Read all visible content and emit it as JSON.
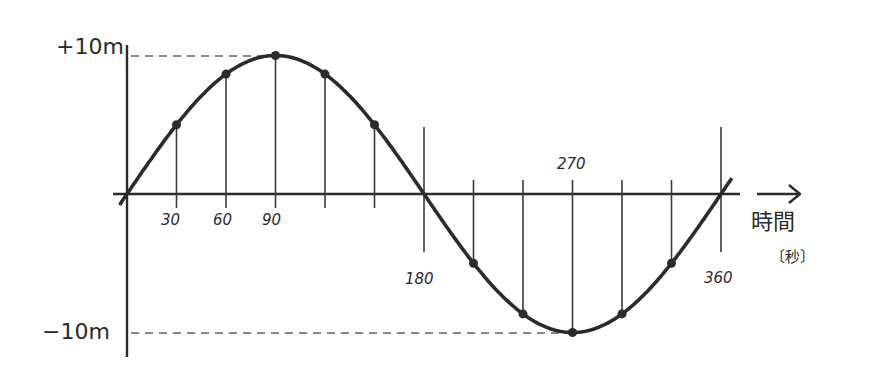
{
  "labels": {
    "y_max": "+10m",
    "y_min": "−10m",
    "x_title": "時間",
    "x_unit": "〔秒〕",
    "ticks": {
      "t30": "30",
      "t60": "60",
      "t90": "90",
      "t180": "180",
      "t270": "270",
      "t360": "360"
    }
  },
  "colors": {
    "curve": "#2b2b2b",
    "axis": "#2b2b2b",
    "guide": "#3a3a3a",
    "dashed": "#888888"
  },
  "chart_data": {
    "type": "line",
    "title": "",
    "xlabel": "時間 〔秒〕",
    "ylabel": "",
    "x": [
      0,
      30,
      60,
      90,
      120,
      150,
      180,
      210,
      240,
      270,
      300,
      330,
      360
    ],
    "series": [
      {
        "name": "displacement (m)",
        "values": [
          0,
          5,
          8.66,
          10,
          8.66,
          5,
          0,
          -5,
          -8.66,
          -10,
          -8.66,
          -5,
          0
        ]
      }
    ],
    "xticks_labeled": [
      30,
      60,
      90,
      180,
      270,
      360
    ],
    "yticks_labeled": [
      "+10m",
      "−10m"
    ],
    "xlim": [
      0,
      360
    ],
    "ylim": [
      -10,
      10
    ],
    "grid": false,
    "markers_at": [
      30,
      60,
      90,
      120,
      150,
      210,
      240,
      270,
      300,
      330
    ],
    "reference_lines": [
      {
        "y": 10,
        "style": "dashed",
        "to_x": 90
      },
      {
        "y": -10,
        "style": "dashed",
        "to_x": 270
      }
    ]
  }
}
